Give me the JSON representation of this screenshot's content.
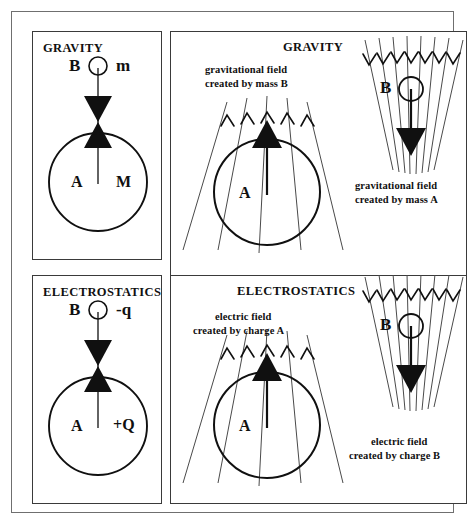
{
  "figure": {
    "alt_title": "Gravity and electrostatics field and force analogy diagram"
  },
  "panels": {
    "gravity_left": {
      "title": "GRAVITY",
      "body_b_label": "B",
      "body_b_symbol": "m",
      "body_a_label": "A",
      "body_a_symbol": "M"
    },
    "electrostatics_left": {
      "title": "ELECTROSTATICS",
      "body_b_label": "B",
      "body_b_symbol": "-q",
      "body_a_label": "A",
      "body_a_symbol": "+Q"
    },
    "gravity_right": {
      "title": "GRAVITY",
      "field_b_caption_line1": "gravitational field",
      "field_b_caption_line2": "created by mass B",
      "field_a_caption_line1": "gravitational field",
      "field_a_caption_line2": "created by mass A",
      "source_a_label": "A",
      "source_b_label": "B"
    },
    "electrostatics_right": {
      "title": "ELECTROSTATICS",
      "field_a_caption_line1": "electric field",
      "field_a_caption_line2": "created by charge A",
      "field_b_caption_line1": "electric field",
      "field_b_caption_line2": "created by charge B",
      "source_a_label": "A",
      "source_b_label": "B"
    }
  },
  "colors": {
    "ink": "#101010",
    "frame": "#6f6f6f",
    "panel_border": "#3a3a3a",
    "field_line": "#4a4a4a",
    "background": "#ffffff"
  }
}
